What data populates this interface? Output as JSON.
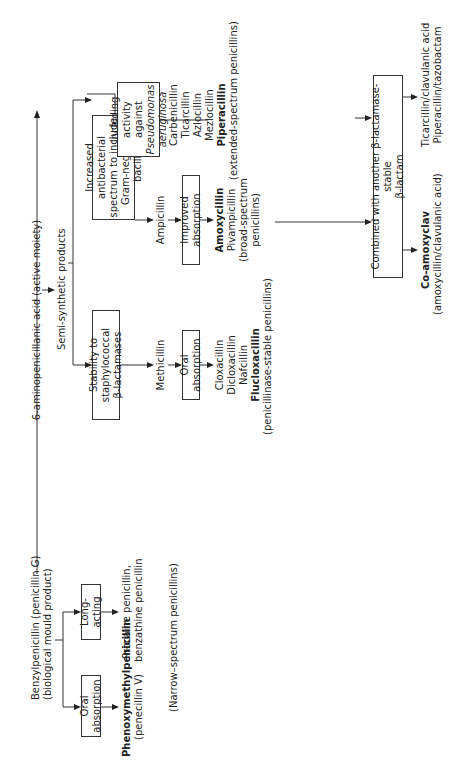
{
  "diagram": {
    "root": {
      "line1": "Benzylpenicillin (penicillin G)",
      "line2": "(biological mould product)"
    },
    "natural_branch": {
      "oral_box": "Oral absorption",
      "long_box": "Long-acting",
      "oral_product": {
        "name": "Phenoxymethylpenicillin",
        "sub": "(penecillin V)"
      },
      "long_product": {
        "line1": "Procaine penicillin,",
        "line2": "benzathine penicillin"
      },
      "group_label": "(Narrow–spectrum penicillins)"
    },
    "apa": "6-aminopenicillanic acid (active moiety)",
    "semi": "Semi-synthetic products",
    "staph_branch": {
      "box_line1": "Stability to staphylococcal",
      "box_line2": "β-lactamases",
      "drug": "Methicillin",
      "oral_box": "Oral absorption",
      "products": [
        "Cloxacillin",
        "Dicloxacillin",
        "Nafcillin"
      ],
      "bold_product": "Flucloxacillin",
      "group_label": "(penicillinase-stable penicillins)"
    },
    "gram_branch": {
      "box_line1": "Increased antibacterial",
      "box_line2": "spectrum to include",
      "box_line3": "Gram-negative bacilli",
      "drug": "Ampicillin",
      "improved_box": "Improved absorption",
      "bold_product": "Amoxycillin",
      "products": [
        "Pivampicillin"
      ],
      "group_line1": "(broad-spectrum",
      "group_line2": "penicillins)",
      "pseudo_box_line1": "Including",
      "pseudo_box_line2": "activity against",
      "pseudo_box_line3": "Pseudomonas",
      "pseudo_box_line4": "aeruginosa",
      "ext_products": [
        "Carbenicillin",
        "Ticarcillin",
        "Azlocillin",
        "Mezlocillin"
      ],
      "ext_bold_product": "Piperacillin",
      "ext_group_label": "(extended-spectrum penicillins)"
    },
    "combined": {
      "box_line1": "Combined with another β-lactamase-stable",
      "box_line2": "β-lactam",
      "co_amox_name": "Co-amoxyclav",
      "co_amox_sub": "(amoxycillin/clavulanic acid)",
      "other_line1": "Ticarcillin/clavulanic acid",
      "other_line2": "Piperacillin/tazobactam"
    }
  }
}
